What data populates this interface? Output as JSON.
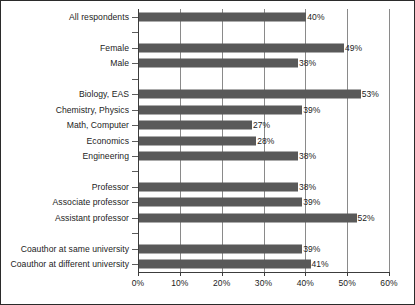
{
  "chart_data": {
    "type": "bar",
    "orientation": "horizontal",
    "title": "",
    "subtitle": "",
    "xlabel": "",
    "ylabel": "",
    "xlim": [
      0,
      60
    ],
    "xtick_labels": [
      "0%",
      "10%",
      "20%",
      "30%",
      "40%",
      "50%",
      "60%"
    ],
    "xtick_values": [
      0,
      10,
      20,
      30,
      40,
      50,
      60
    ],
    "grid": true,
    "legend": null,
    "bar_color": "#595959",
    "axis_color": "#3c3c3c",
    "gridline_color": "#8a8a8a",
    "text_color": "#1c1c1c",
    "value_label_suffix": "%",
    "categories": [
      "All respondents",
      "Female",
      "Male",
      "Biology, EAS",
      "Chemistry, Physics",
      "Math, Computer",
      "Economics",
      "Engineering",
      "Professor",
      "Associate professor",
      "Assistant professor",
      "Coauthor at same university",
      "Coauthor at different university"
    ],
    "values": [
      40,
      49,
      38,
      53,
      39,
      27,
      28,
      38,
      38,
      39,
      52,
      39,
      41
    ],
    "value_labels": [
      "40%",
      "49%",
      "38%",
      "53%",
      "39%",
      "27%",
      "28%",
      "38%",
      "38%",
      "39%",
      "52%",
      "39%",
      "41%"
    ],
    "groups": [
      {
        "name": "overall",
        "categories": [
          "All respondents"
        ]
      },
      {
        "name": "gender",
        "categories": [
          "Female",
          "Male"
        ]
      },
      {
        "name": "field",
        "categories": [
          "Biology, EAS",
          "Chemistry, Physics",
          "Math, Computer",
          "Economics",
          "Engineering"
        ]
      },
      {
        "name": "rank",
        "categories": [
          "Professor",
          "Associate professor",
          "Assistant professor"
        ]
      },
      {
        "name": "coauthor-location",
        "categories": [
          "Coauthor at same university",
          "Coauthor at different university"
        ]
      }
    ],
    "slots": [
      {
        "type": "bar",
        "category": "All respondents",
        "value": 40,
        "label": "40%"
      },
      {
        "type": "gap"
      },
      {
        "type": "bar",
        "category": "Female",
        "value": 49,
        "label": "49%"
      },
      {
        "type": "bar",
        "category": "Male",
        "value": 38,
        "label": "38%"
      },
      {
        "type": "gap"
      },
      {
        "type": "bar",
        "category": "Biology, EAS",
        "value": 53,
        "label": "53%"
      },
      {
        "type": "bar",
        "category": "Chemistry, Physics",
        "value": 39,
        "label": "39%"
      },
      {
        "type": "bar",
        "category": "Math, Computer",
        "value": 27,
        "label": "27%"
      },
      {
        "type": "bar",
        "category": "Economics",
        "value": 28,
        "label": "28%"
      },
      {
        "type": "bar",
        "category": "Engineering",
        "value": 38,
        "label": "38%"
      },
      {
        "type": "gap"
      },
      {
        "type": "bar",
        "category": "Professor",
        "value": 38,
        "label": "38%"
      },
      {
        "type": "bar",
        "category": "Associate professor",
        "value": 39,
        "label": "39%"
      },
      {
        "type": "bar",
        "category": "Assistant professor",
        "value": 52,
        "label": "52%"
      },
      {
        "type": "gap"
      },
      {
        "type": "bar",
        "category": "Coauthor at same university",
        "value": 39,
        "label": "39%"
      },
      {
        "type": "bar",
        "category": "Coauthor at different university",
        "value": 41,
        "label": "41%"
      }
    ]
  }
}
